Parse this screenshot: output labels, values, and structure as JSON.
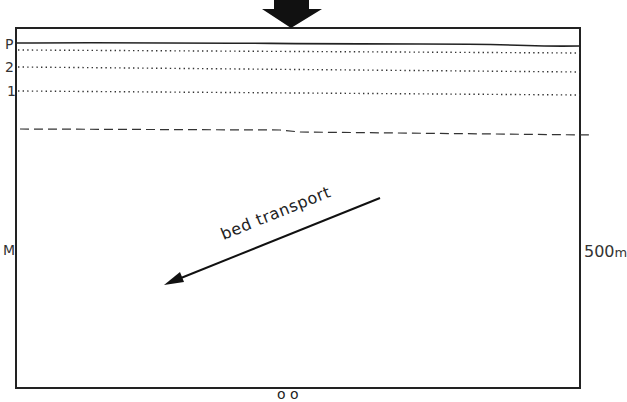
{
  "diagram": {
    "labels": {
      "p": "P",
      "level_2": "2",
      "level_1": "1",
      "m": "M",
      "scale_value": "500",
      "scale_unit": "m",
      "transport": "bed transport",
      "bottom_cut": "o o"
    },
    "elements": {
      "input_arrow": "downward-block-arrow",
      "transport_arrow": "diagonal-arrow-southwest"
    },
    "colors": {
      "line": "#222222",
      "background": "#ffffff"
    }
  }
}
